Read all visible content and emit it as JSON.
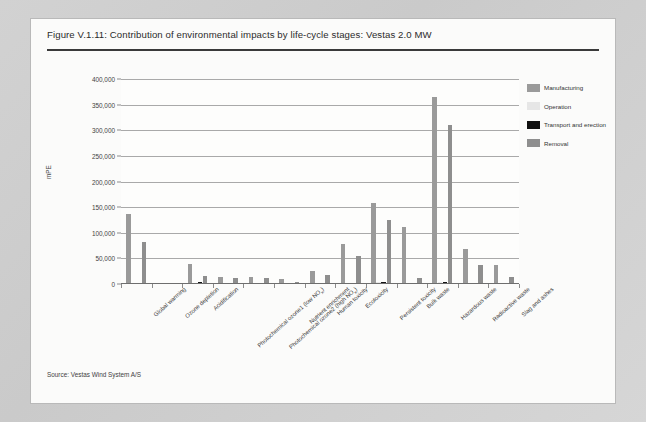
{
  "figure": {
    "title": "Figure V.1.11: Contribution of environmental impacts by life-cycle stages: Vestas 2.0 MW",
    "source": "Source: Vestas Wind System A/S"
  },
  "legend": {
    "position": "right",
    "items": [
      {
        "label": "Manufacturing",
        "color": "#9a9a9a",
        "key": "manufacturing"
      },
      {
        "label": "Operation",
        "color": "#e6e6e6",
        "key": "operation"
      },
      {
        "label": "Transport and erection",
        "color": "#101010",
        "key": "transport"
      },
      {
        "label": "Removal",
        "color": "#8e8e8e",
        "key": "removal"
      }
    ]
  },
  "chart_data": {
    "type": "bar",
    "title": "Contribution of environmental impacts by life-cycle stages: Vestas 2.0 MW",
    "xlabel": "",
    "ylabel": "mPE",
    "ylim": [
      0,
      400000
    ],
    "ytick_values": [
      0,
      50000,
      100000,
      150000,
      200000,
      250000,
      300000,
      350000,
      400000
    ],
    "ytick_labels": [
      "0",
      "50,000",
      "100,000",
      "150,000",
      "200,000",
      "250,000",
      "300,000",
      "350,000",
      "400,000"
    ],
    "grid": true,
    "grouping": "grouped",
    "categories": [
      "Global warming",
      "Ozone depletion",
      "Acidification",
      "Photochemical ozone1 (low NOx)",
      "Photochemical ozone2 (high NOx)",
      "Nutrient enrichment",
      "Human toxicity",
      "Ecotoxicity",
      "Persistent toxicity",
      "Bulk waste",
      "Hazardous waste",
      "Radioactive waste",
      "Slag and ashes"
    ],
    "series": [
      {
        "name": "Manufacturing",
        "color": "#9a9a9a",
        "values": [
          137000,
          900,
          39000,
          13000,
          13000,
          10000,
          25000,
          78000,
          158000,
          112000,
          365000,
          68000,
          37000
        ]
      },
      {
        "name": "Operation",
        "color": "#e6e6e6",
        "values": [
          500,
          200,
          1500,
          600,
          600,
          400,
          900,
          2000,
          3000,
          2500,
          4000,
          1500,
          1200
        ]
      },
      {
        "name": "Transport and erection",
        "color": "#101010",
        "values": [
          1200,
          150,
          3500,
          2200,
          2500,
          1200,
          1500,
          2500,
          3000,
          2000,
          3500,
          1500,
          1200
        ]
      },
      {
        "name": "Removal",
        "color": "#8e8e8e",
        "values": [
          82000,
          600,
          15000,
          11000,
          12000,
          3000,
          17000,
          55000,
          125000,
          12000,
          310000,
          38000,
          13000
        ]
      }
    ]
  }
}
